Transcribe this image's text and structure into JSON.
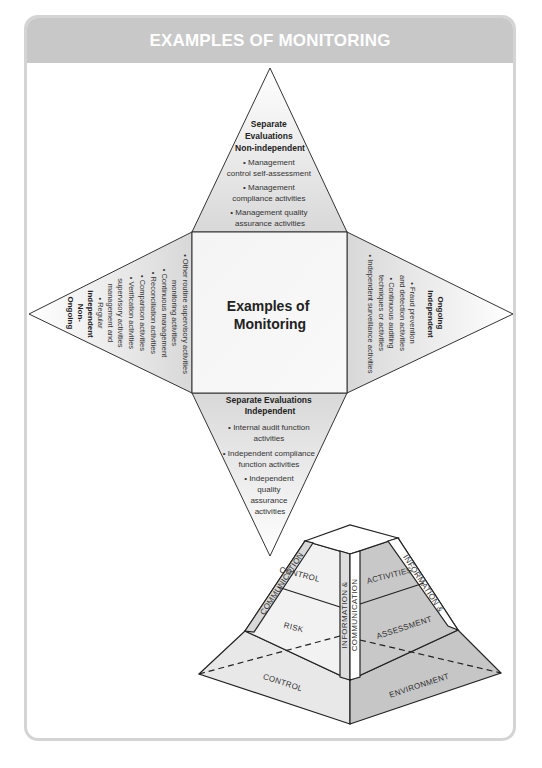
{
  "panel": {
    "title": "EXAMPLES OF MONITORING",
    "header_color": "#c8c8c8",
    "border_color": "#d4d4d4"
  },
  "center": {
    "line1": "Examples of",
    "line2": "Monitoring"
  },
  "top_triangle": {
    "heading": [
      "Separate",
      "Evaluations",
      "Non-independent"
    ],
    "items": [
      [
        "• Management",
        "control self-assessment"
      ],
      [
        "• Management",
        "compliance activities"
      ],
      [
        "• Management quality",
        "assurance activities"
      ]
    ]
  },
  "bottom_triangle": {
    "heading": [
      "Separate Evaluations",
      "Independent"
    ],
    "items": [
      [
        "• Internal audit function",
        "activities"
      ],
      [
        "• Independent compliance",
        "function activities"
      ],
      [
        "• Independent",
        "quality",
        "assurance",
        "activities"
      ]
    ]
  },
  "left_triangle": {
    "heading": [
      "Ongoing",
      "Non-",
      "independent"
    ],
    "items": [
      "• Regular",
      "management and",
      "supervisory activities",
      "• Verification activities",
      "• Comparison activities",
      "• Reconciliation activities",
      "• Continuous management",
      "monitoring activities",
      "• Other routine supervisory activities"
    ]
  },
  "right_triangle": {
    "heading": [
      "Ongoing",
      "Independent"
    ],
    "items": [
      "• Fraud prevention",
      "and detection activities",
      "• Continuous auditing",
      "techniques or activities",
      "• Independent surveillance activities"
    ]
  },
  "pyramid": {
    "left_face": [
      "CONTROL",
      "RISK"
    ],
    "right_face": [
      "ACTIVITIES",
      "ASSESSMENT"
    ],
    "base_left": "CONTROL",
    "base_right": "ENVIRONMENT",
    "left_edge_band": "COMMUNICATION",
    "right_edge_band": "INFORMATION &",
    "center_band_1": "INFORMATION &",
    "center_band_2": "COMMUNICATION",
    "shade_light": "#e6e6e6",
    "shade_dark": "#c4c4c4"
  }
}
